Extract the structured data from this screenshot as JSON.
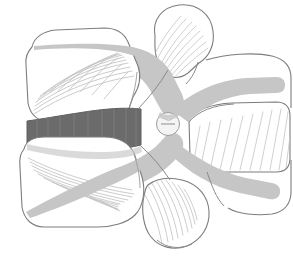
{
  "figure": {
    "domain": "medical-anatomical-illustration",
    "width": 293,
    "height": 259,
    "background_color": "#ffffff",
    "caption": ""
  },
  "palette": {
    "background": "#ffffff",
    "outline": "#7d7d7d",
    "outline_dark": "#6a6a6a",
    "bone_fill": "#ffffff",
    "cortical_gray": "#c6c6c6",
    "cortical_gray_light": "#d2d2d2",
    "disc_gray": "#6b6b6b",
    "disc_gray_dark": "#5e5e5e",
    "trabecula_line": "#bcbcbc",
    "hatch_line": "#c0c0c0",
    "foramen_fill": "#f4f4f4"
  },
  "style": {
    "outline_width": 1.1,
    "trabecula_width": 0.85,
    "hatch_width": 0.8,
    "disc_stripe_width": 0.7
  },
  "structures": [
    {
      "id": "vertebral-body-superior",
      "label": "Superior vertebral body",
      "fill": "#ffffff",
      "stroke": "#7d7d7d"
    },
    {
      "id": "vertebral-body-inferior",
      "label": "Inferior vertebral body",
      "fill": "#ffffff",
      "stroke": "#7d7d7d"
    },
    {
      "id": "intervertebral-disc",
      "label": "Intervertebral disc",
      "fill": "#6b6b6b",
      "stroke": "#5e5e5e",
      "stripe_count": 9
    },
    {
      "id": "superior-endplate-band",
      "label": "Superior cortical endplate band",
      "fill": "#c6c6c6"
    },
    {
      "id": "inferior-endplate-band",
      "label": "Inferior cortical endplate band",
      "fill": "#c6c6c6"
    },
    {
      "id": "pedicle",
      "label": "Pedicle",
      "fill": "#c6c6c6"
    },
    {
      "id": "superior-articular-process",
      "label": "Superior articular process",
      "fill": "#ffffff",
      "stroke": "#7d7d7d"
    },
    {
      "id": "inferior-articular-process",
      "label": "Inferior articular process",
      "fill": "#ffffff",
      "stroke": "#7d7d7d"
    },
    {
      "id": "spinous-process",
      "label": "Spinous process",
      "fill": "#ffffff",
      "stroke": "#7d7d7d",
      "hatch_count": 11
    },
    {
      "id": "lamina",
      "label": "Lamina",
      "fill": "#c6c6c6"
    },
    {
      "id": "vertebral-foramen",
      "label": "Vertebral foramen / neural canal",
      "fill": "#f4f4f4",
      "center_x": 168,
      "center_y": 124,
      "radius": 11
    },
    {
      "id": "trabecular-lines-superior",
      "label": "Trabecular bone lines, superior body",
      "line_count": 13
    },
    {
      "id": "trabecular-lines-inferior",
      "label": "Trabecular bone lines, inferior body",
      "line_count": 11
    },
    {
      "id": "trabecular-lines-sap",
      "label": "Trabecular bone lines, superior articular process",
      "line_count": 10
    },
    {
      "id": "trabecular-lines-iap",
      "label": "Trabecular bone lines, inferior articular process",
      "line_count": 9
    }
  ]
}
